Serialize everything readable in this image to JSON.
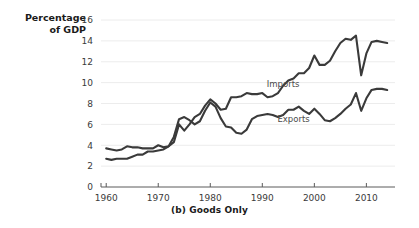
{
  "chart_data": {
    "type": "line",
    "title": "",
    "caption": "(b) Goods Only",
    "ylabel": "Percentage\nof GDP",
    "xlabel": "",
    "xlim": [
      1959,
      2015.5
    ],
    "ylim": [
      0,
      16
    ],
    "grid": true,
    "legend_position": "inline-labels",
    "yticks": [
      0,
      2,
      4,
      6,
      8,
      10,
      12,
      14,
      16
    ],
    "ytick_labels": [
      "0",
      "2",
      "4",
      "6",
      "8",
      "10",
      "12",
      "14",
      "16"
    ],
    "xticks": [
      1960,
      1970,
      1980,
      1990,
      2000,
      2010
    ],
    "xtick_labels": [
      "1960",
      "1970",
      "1980",
      "1990",
      "2000",
      "2010"
    ],
    "series": [
      {
        "name": "Imports",
        "color": "#3a3a3a",
        "label_x": 1994,
        "label_y": 9.6,
        "x": [
          1960,
          1961,
          1962,
          1963,
          1964,
          1965,
          1966,
          1967,
          1968,
          1969,
          1970,
          1971,
          1972,
          1973,
          1974,
          1975,
          1976,
          1977,
          1978,
          1979,
          1980,
          1981,
          1982,
          1983,
          1984,
          1985,
          1986,
          1987,
          1988,
          1989,
          1990,
          1991,
          1992,
          1993,
          1994,
          1995,
          1996,
          1997,
          1998,
          1999,
          2000,
          2001,
          2002,
          2003,
          2004,
          2005,
          2006,
          2007,
          2008,
          2009,
          2010,
          2011,
          2012,
          2013,
          2014
        ],
        "values": [
          2.7,
          2.6,
          2.7,
          2.7,
          2.7,
          2.9,
          3.1,
          3.1,
          3.4,
          3.4,
          3.5,
          3.6,
          3.9,
          4.3,
          6.0,
          5.4,
          6.0,
          6.7,
          7.0,
          7.8,
          8.4,
          8.0,
          7.4,
          7.5,
          8.6,
          8.6,
          8.7,
          9.0,
          8.9,
          8.9,
          9.0,
          8.6,
          8.7,
          9.0,
          9.7,
          10.2,
          10.4,
          10.9,
          10.9,
          11.4,
          12.6,
          11.7,
          11.7,
          12.1,
          13.0,
          13.8,
          14.2,
          14.1,
          14.5,
          10.7,
          12.8,
          13.9,
          14.0,
          13.9,
          13.8
        ]
      },
      {
        "name": "Exports",
        "color": "#3a3a3a",
        "label_x": 1996,
        "label_y": 6.2,
        "x": [
          1960,
          1961,
          1962,
          1963,
          1964,
          1965,
          1966,
          1967,
          1968,
          1969,
          1970,
          1971,
          1972,
          1973,
          1974,
          1975,
          1976,
          1977,
          1978,
          1979,
          1980,
          1981,
          1982,
          1983,
          1984,
          1985,
          1986,
          1987,
          1988,
          1989,
          1990,
          1991,
          1992,
          1993,
          1994,
          1995,
          1996,
          1997,
          1998,
          1999,
          2000,
          2001,
          2002,
          2003,
          2004,
          2005,
          2006,
          2007,
          2008,
          2009,
          2010,
          2011,
          2012,
          2013,
          2014
        ],
        "values": [
          3.7,
          3.6,
          3.5,
          3.6,
          3.9,
          3.8,
          3.8,
          3.7,
          3.7,
          3.7,
          4.0,
          3.8,
          3.9,
          4.8,
          6.5,
          6.7,
          6.4,
          6.0,
          6.3,
          7.3,
          8.1,
          7.7,
          6.6,
          5.8,
          5.7,
          5.2,
          5.1,
          5.5,
          6.5,
          6.8,
          6.9,
          7.0,
          6.9,
          6.7,
          6.9,
          7.4,
          7.4,
          7.7,
          7.3,
          7.0,
          7.5,
          7.0,
          6.4,
          6.3,
          6.6,
          7.0,
          7.5,
          7.9,
          9.0,
          7.3,
          8.5,
          9.3,
          9.4,
          9.4,
          9.3
        ]
      }
    ]
  }
}
